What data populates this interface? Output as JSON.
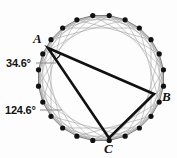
{
  "figure": {
    "name": "inscribed-triangle-in-regular-polygon",
    "background_color": "#fdfdfd",
    "circle": {
      "cx": 101,
      "cy": 78,
      "r": 63,
      "vertex_count": 24,
      "vertex_dot_radius": 2.6,
      "vertex_dot_color": "#111111",
      "chord_color": "#9a9a9a",
      "chord_width": 0.55,
      "polygon_edge_color": "#5a5a5a",
      "polygon_edge_width": 0.8,
      "chord_skip_steps": [
        2,
        3,
        5
      ]
    },
    "triangle": {
      "stroke_color": "#111111",
      "stroke_width": 2.6,
      "vertices": [
        {
          "name": "A",
          "index": 15,
          "x": 48,
          "y": 48
        },
        {
          "name": "B",
          "index": 2,
          "x": 154,
          "y": 94
        },
        {
          "name": "C",
          "index": 7,
          "x": 109,
          "y": 138
        }
      ]
    },
    "angle_arc": {
      "at_vertex": "A",
      "cx": 48,
      "cy": 48,
      "radius": 14,
      "stroke_color": "#111111",
      "stroke_width": 1.2
    },
    "leader_lines": [
      {
        "name": "leader-angle-a",
        "x1": 36,
        "y1": 63,
        "x2": 56,
        "y2": 63,
        "color": "#8d8d8d",
        "width": 1.0
      },
      {
        "name": "leader-angle-c",
        "x1": 40,
        "y1": 110,
        "x2": 62,
        "y2": 110,
        "color": "#8d8d8d",
        "width": 1.0
      }
    ],
    "labels": {
      "angle_a": "34.6°",
      "angle_c": "124.6°",
      "vertex_a": "A",
      "vertex_b": "B",
      "vertex_c": "C"
    }
  }
}
